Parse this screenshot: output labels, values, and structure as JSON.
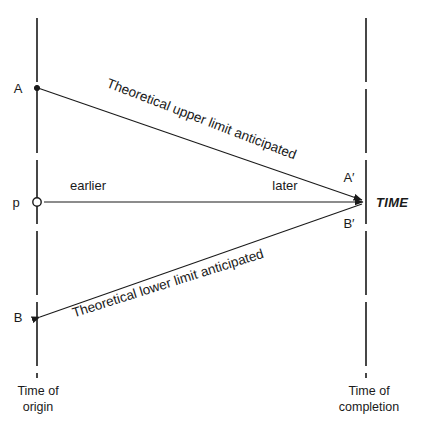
{
  "diagram": {
    "colors": {
      "ink": "#1a1a1a",
      "background": "#ffffff"
    },
    "axes": {
      "origin_axis": {
        "label": "Time of\norigin",
        "x": 37,
        "y_top": 18,
        "y_bottom": 378
      },
      "completion_axis": {
        "label": "Time of\ncompletion",
        "x": 366,
        "y_top": 18,
        "y_bottom": 378
      }
    },
    "points": {
      "A": {
        "label": "A",
        "x": 37,
        "y": 88,
        "marker": "filled-dot"
      },
      "p": {
        "label": "p",
        "x": 37,
        "y": 202,
        "marker": "open-circle"
      },
      "B": {
        "label": "B",
        "x": 37,
        "y": 317,
        "marker": "arrowhead"
      },
      "A_prime": {
        "label": "A′",
        "x": 366,
        "y": 202
      },
      "B_prime": {
        "label": "B′",
        "x": 366,
        "y": 202
      }
    },
    "rays": {
      "upper": {
        "label": "Theoretical upper limit anticipated",
        "from": "A",
        "to": "A_prime"
      },
      "middle": {
        "label_left": "earlier",
        "label_right": "later",
        "from": "p",
        "to": "TIME"
      },
      "lower": {
        "label": "Theoretical lower limit anticipated",
        "from": "B",
        "to": "B_prime"
      }
    },
    "time_label": "TIME"
  }
}
